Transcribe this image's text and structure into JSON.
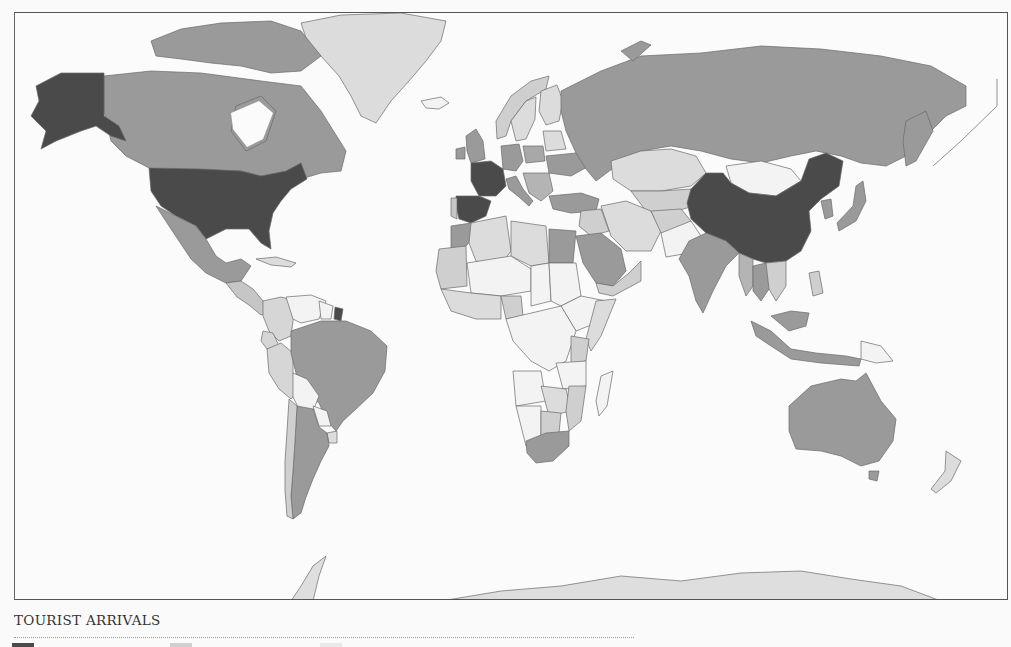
{
  "caption": {
    "title": "TOURIST ARRIVALS"
  },
  "palette": {
    "tier1_darkest": "#4a4a4a",
    "tier2_mid": "#9a9a9a",
    "tier3_light": "#c6c6c6",
    "tier4_lighter": "#dddddd",
    "tier5_lowest": "#f3f3f3",
    "ocean": "#fbfbfb",
    "border": "#6a6a6a"
  },
  "legend": {
    "swatches": [
      {
        "tier": "tier1_darkest",
        "color": "#4a4a4a"
      },
      {
        "tier": "tier3_light",
        "color": "#cfcfcf"
      },
      {
        "tier": "tier5_lowest",
        "color": "#e9e9e9"
      }
    ]
  },
  "map": {
    "projection": "world",
    "shading": {
      "tier1_darkest": [
        "United States",
        "France",
        "Spain",
        "China",
        "French Guiana"
      ],
      "tier2_mid": [
        "Canada",
        "Mexico",
        "Brazil",
        "Argentina",
        "Russia",
        "Germany",
        "United Kingdom",
        "Italy",
        "Turkey",
        "Ukraine",
        "Egypt",
        "Saudi Arabia",
        "India",
        "Thailand",
        "Malaysia",
        "Japan",
        "South Korea",
        "Australia",
        "South Africa",
        "Indonesia",
        "Morocco"
      ],
      "tier3_light": [
        "Greenland",
        "Kazakhstan",
        "Iran",
        "Peru",
        "Colombia",
        "Algeria",
        "Libya",
        "Nigeria",
        "Kenya",
        "Mozambique",
        "Zimbabwe",
        "Botswana",
        "New Zealand",
        "Antarctica",
        "Sweden",
        "Finland",
        "Norway",
        "Poland",
        "Oman",
        "Yemen",
        "Afghanistan",
        "Uruguay",
        "Chile"
      ],
      "tier5_lowest": [
        "Mongolia",
        "Bolivia",
        "Venezuela",
        "Paraguay",
        "Chad",
        "Niger",
        "Mali",
        "Sudan",
        "DR Congo",
        "Angola",
        "Namibia",
        "Ethiopia",
        "Tanzania",
        "Zambia",
        "Madagascar",
        "Pakistan",
        "Papua New Guinea",
        "Iceland"
      ]
    }
  }
}
